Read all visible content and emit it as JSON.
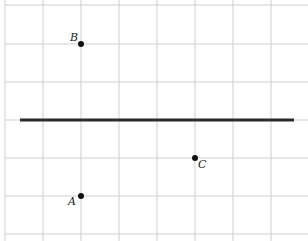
{
  "diagram": {
    "grid": {
      "x_lines": [
        5,
        43,
        81,
        119,
        157,
        195,
        233,
        271
      ],
      "y_lines": [
        5,
        44,
        82,
        120,
        158,
        196,
        234
      ],
      "color": "#cfcfcf"
    },
    "line": {
      "x1": 20,
      "y1": 120,
      "x2": 294,
      "y2": 120,
      "color": "#2a2a2a",
      "width": 3
    },
    "points": [
      {
        "label": "B",
        "x": 81,
        "y": 44,
        "lx": 70,
        "ly": 41
      },
      {
        "label": "A",
        "x": 81,
        "y": 196,
        "lx": 68,
        "ly": 205
      },
      {
        "label": "C",
        "x": 195,
        "y": 158,
        "lx": 198,
        "ly": 168
      }
    ]
  }
}
